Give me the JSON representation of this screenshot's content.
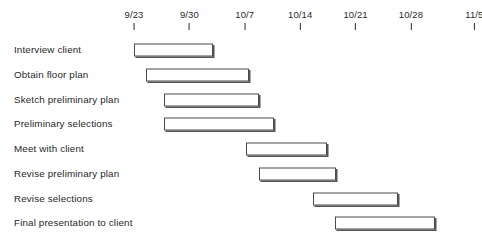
{
  "chart_data": {
    "type": "bar",
    "chart_subtype": "gantt",
    "title": "",
    "xlabel": "",
    "ylabel": "",
    "grid": false,
    "legend": null,
    "axis": {
      "orientation": "top",
      "tick_labels": [
        "9/23",
        "9/30",
        "10/7",
        "10/14",
        "10/21",
        "10/28",
        "11/5"
      ],
      "tick_day_offsets": [
        0,
        7,
        14,
        21,
        28,
        35,
        43
      ],
      "day_zero_label": "9/23",
      "pixels_per_day": 7.914,
      "axis_origin_px": 134,
      "xlim_days": [
        -2,
        45
      ]
    },
    "categories": [
      "Interview client",
      "Obtain floor plan",
      "Sketch preliminary plan",
      "Preliminary selections",
      "Meet with client",
      "Revise preliminary plan",
      "Revise selections",
      "Final presentation to client"
    ],
    "tasks": [
      {
        "label": "Interview client",
        "start_day": 0.0,
        "end_day": 10.0,
        "duration_days": 10.0,
        "start_label": "9/23",
        "end_label": "10/3",
        "bar_left_px": 134,
        "bar_width_px": 79
      },
      {
        "label": "Obtain floor plan",
        "start_day": 1.5,
        "end_day": 14.5,
        "duration_days": 13.0,
        "start_label": "9/24",
        "end_label": "10/7",
        "bar_left_px": 146,
        "bar_width_px": 103
      },
      {
        "label": "Sketch preliminary plan",
        "start_day": 3.8,
        "end_day": 15.8,
        "duration_days": 12.0,
        "start_label": "9/27",
        "end_label": "10/9",
        "bar_left_px": 164,
        "bar_width_px": 95
      },
      {
        "label": "Preliminary selections",
        "start_day": 3.8,
        "end_day": 17.7,
        "duration_days": 13.9,
        "start_label": "9/27",
        "end_label": "10/11",
        "bar_left_px": 164,
        "bar_width_px": 110
      },
      {
        "label": "Meet with client",
        "start_day": 14.2,
        "end_day": 24.4,
        "duration_days": 10.2,
        "start_label": "10/7",
        "end_label": "10/17",
        "bar_left_px": 246,
        "bar_width_px": 81
      },
      {
        "label": "Revise preliminary plan",
        "start_day": 15.8,
        "end_day": 25.5,
        "duration_days": 9.7,
        "start_label": "10/9",
        "end_label": "10/18",
        "bar_left_px": 259,
        "bar_width_px": 77
      },
      {
        "label": "Revise selections",
        "start_day": 22.6,
        "end_day": 33.4,
        "duration_days": 10.8,
        "start_label": "10/15",
        "end_label": "10/26",
        "bar_left_px": 313,
        "bar_width_px": 85
      },
      {
        "label": "Final presentation to client",
        "start_day": 25.4,
        "end_day": 38.0,
        "duration_days": 12.6,
        "start_label": "10/18",
        "end_label": "10/31",
        "bar_left_px": 335,
        "bar_width_px": 100
      }
    ],
    "colors": {
      "bar_fill": "#ffffff",
      "bar_border": "#4a4a4a",
      "bar_shadow": "#555555",
      "axis_tick": "#2b2b2b",
      "text": "#1f1f1f",
      "background": "#ffffff"
    }
  }
}
